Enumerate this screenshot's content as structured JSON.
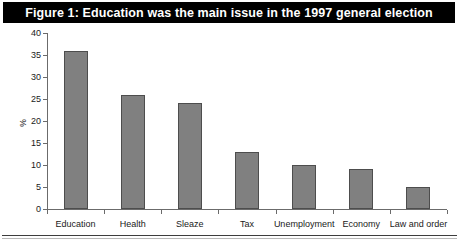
{
  "figure": {
    "title": "Figure 1: Education was the main issue in the 1997 general election",
    "title_background": "#000000",
    "title_color": "#ffffff"
  },
  "chart_data": {
    "type": "bar",
    "title": "Figure 1: Education was the main issue in the 1997 general election",
    "categories": [
      "Education",
      "Health",
      "Sleaze",
      "Tax",
      "Unemployment",
      "Economy",
      "Law and order"
    ],
    "values": [
      36,
      26,
      24,
      13,
      10,
      9,
      5
    ],
    "xlabel": "",
    "ylabel": "%",
    "ylim": [
      0,
      40
    ],
    "ytick_values": [
      0,
      5,
      10,
      15,
      20,
      25,
      30,
      35,
      40
    ],
    "ytick_labels": [
      "0",
      "5",
      "10",
      "15",
      "20",
      "25",
      "30",
      "35",
      "40"
    ],
    "grid": false,
    "legend": false,
    "bar_color": "#808080",
    "bar_edge_color": "#4d4d4d",
    "axis_color": "#6b6b6b"
  }
}
